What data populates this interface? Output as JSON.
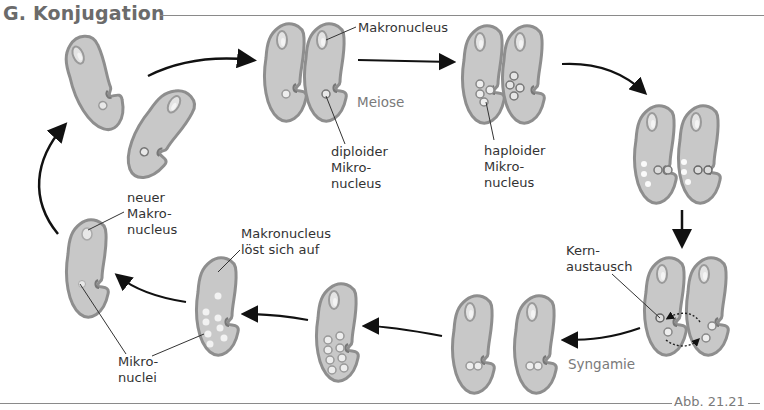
{
  "title": "G. Konjugation",
  "figure_ref": "Abb. 21.21",
  "labels": {
    "makronucleus_top": "Makronucleus",
    "meiose": "Meiose",
    "diploider": [
      "diploider",
      "Mikro-",
      "nucleus"
    ],
    "haploider": [
      "haploider",
      "Mikro-",
      "nucleus"
    ],
    "kernaustausch": [
      "Kern-",
      "austausch"
    ],
    "syngamie": "Syngamie",
    "makronucleus_loest": [
      "Makronucleus",
      "löst sich auf"
    ],
    "neuer": [
      "neuer",
      "Makro-",
      "nucleus"
    ],
    "mikronuclei": [
      "Mikro-",
      "nuclei"
    ]
  },
  "stages": [
    {
      "id": 1,
      "name": "two separate paramecia"
    },
    {
      "id": 2,
      "name": "paired cells with diploid micronucleus"
    },
    {
      "id": 3,
      "name": "meiosis: four haploid micronuclei each"
    },
    {
      "id": 4,
      "name": "three nuclei degenerate"
    },
    {
      "id": 5,
      "name": "nuclear exchange (Kernaustausch)"
    },
    {
      "id": 6,
      "name": "separated after syngamy"
    },
    {
      "id": 7,
      "name": "eight micronuclei"
    },
    {
      "id": 8,
      "name": "macronucleus dissolves"
    },
    {
      "id": 9,
      "name": "new macronucleus and micronuclei"
    }
  ],
  "colors": {
    "cell_fill": "#c8c8c8",
    "cell_border": "#8e8e8e",
    "title": "#6b6b6b",
    "arrow": "#111111"
  }
}
